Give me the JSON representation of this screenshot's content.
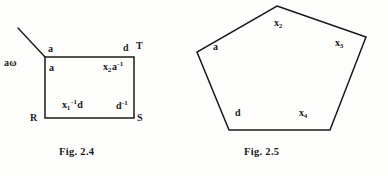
{
  "page": {
    "background_color": "#fdfdfb",
    "ink_color": "#1b1b1b"
  },
  "figure_24": {
    "caption": "Fig. 2.4",
    "labels": {
      "a_omega": "aω",
      "a_top_edge": "a",
      "a_inside": "a",
      "d_top_edge": "d",
      "vertex_T": "T",
      "vertex_R": "R",
      "vertex_S": "S",
      "x2_a_inv_base": "x",
      "x2_a_inv_sub": "2",
      "x2_a_inv_mid": "a",
      "x2_a_inv_sup": "-1",
      "x1_inv_d_base": "x",
      "x1_inv_d_sub": "1",
      "x1_inv_d_sup": "-1",
      "x1_inv_d_tail": "d",
      "d_inv_base": "d",
      "d_inv_sup": "-1"
    },
    "shape": {
      "type": "rectangle-with-incoming-edge",
      "rect": {
        "left": 45,
        "top": 57,
        "right": 134,
        "bottom": 118
      },
      "incoming_edge": {
        "x1": 18,
        "y1": 28,
        "x2": 45,
        "y2": 57
      }
    }
  },
  "figure_25": {
    "caption": "Fig. 2.5",
    "labels": {
      "x2_base": "x",
      "x2_sub": "2",
      "x3_base": "x",
      "x3_sub": "3",
      "x4_base": "x",
      "x4_sub": "4",
      "a": "a",
      "d": "d"
    },
    "shape": {
      "type": "pentagon",
      "vertices": [
        {
          "x": 83,
          "y": 6
        },
        {
          "x": 172,
          "y": 37
        },
        {
          "x": 136,
          "y": 130
        },
        {
          "x": 35,
          "y": 130
        },
        {
          "x": 3,
          "y": 52
        }
      ]
    }
  }
}
